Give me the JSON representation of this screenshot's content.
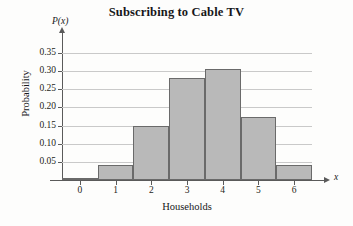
{
  "chart_data": {
    "type": "bar",
    "title": "Subscribing to Cable TV",
    "xlabel": "Households",
    "ylabel": "Probability",
    "x_axis_variable": "x",
    "y_axis_variable": "P(x)",
    "categories": [
      "0",
      "1",
      "2",
      "3",
      "4",
      "5",
      "6"
    ],
    "values": [
      0.005,
      0.042,
      0.148,
      0.282,
      0.306,
      0.175,
      0.042
    ],
    "ylim": [
      0,
      0.375
    ],
    "xlim": [
      -0.5,
      6.5
    ],
    "ytick_labels": [
      "0.05",
      "0.10",
      "0.15",
      "0.20",
      "0.25",
      "0.30",
      "0.35"
    ],
    "ytick_values": [
      0.05,
      0.1,
      0.15,
      0.2,
      0.25,
      0.3,
      0.35
    ],
    "xtick_labels": [
      "0",
      "1",
      "2",
      "3",
      "4",
      "5",
      "6"
    ],
    "grid": "horizontal",
    "legend": "none",
    "bar_fill_color": "#b9b9b9",
    "bar_border_color": "#6a6a6a",
    "gridline_color": "#c9c9c9",
    "axis_color": "#5a5a5a",
    "background_color": "#fdfdfc",
    "text_color": "#17171a"
  }
}
